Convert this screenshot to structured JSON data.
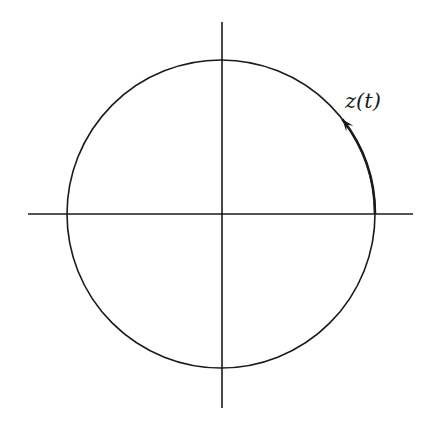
{
  "diagram": {
    "title": "",
    "colors": {
      "stroke": "#1a1a1a",
      "background": "#ffffff"
    },
    "axes": {
      "horizontal": {
        "x1": 28,
        "x2": 413,
        "y": 214
      },
      "vertical": {
        "x": 222,
        "y1": 22,
        "y2": 408
      }
    },
    "circle": {
      "cx": 221,
      "cy": 214,
      "r": 154
    },
    "path_highlight": {
      "start_angle_deg": 0,
      "end_angle_deg": 38,
      "direction": "counterclockwise"
    },
    "label": {
      "text": "z(t)",
      "x": 345,
      "y": 108
    }
  }
}
